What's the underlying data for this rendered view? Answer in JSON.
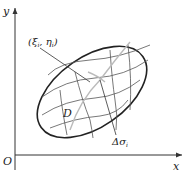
{
  "diagram": {
    "axes": {
      "x_label": "x",
      "y_label": "y",
      "origin_label": "O"
    },
    "region_label": "D",
    "point_label": "(ξ",
    "point_sub_i": "i",
    "point_comma": ", η",
    "point_close": ")",
    "area_label": "Δσ",
    "area_sub": "i",
    "colors": {
      "stroke": "#222222",
      "grid": "#555555",
      "highlight": "#bbbbbb"
    }
  }
}
